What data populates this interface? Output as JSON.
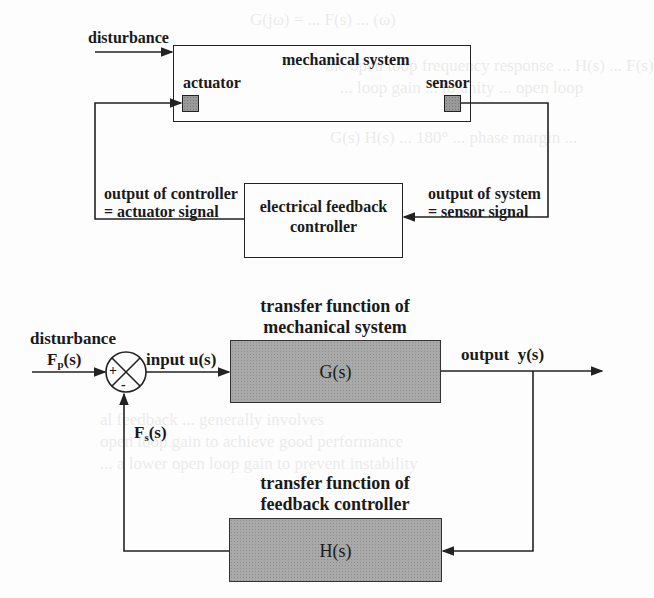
{
  "figure": {
    "top_diagram": {
      "input_label": "disturbance",
      "mechanical_box": {
        "title": "mechanical system",
        "actuator_label": "actuator",
        "sensor_label": "sensor"
      },
      "controller_box": {
        "line1": "electrical feedback",
        "line2": "controller"
      },
      "left_annotation": {
        "line1": "output of controller",
        "line2": "= actuator signal"
      },
      "right_annotation": {
        "line1": "output of system",
        "line2": "= sensor signal"
      }
    },
    "block_diagram": {
      "disturbance_label": "disturbance",
      "disturbance_signal": "F",
      "disturbance_sub": "p",
      "disturbance_arg": "(s)",
      "summing_junction": {
        "plus": "+",
        "minus": "-"
      },
      "input_label": "input u(s)",
      "plant": {
        "caption_line1": "transfer function of",
        "caption_line2": "mechanical system",
        "label": "G(s)"
      },
      "output_label": "output  y(s)",
      "feedback_signal": "F",
      "feedback_sub": "s",
      "feedback_arg": "(s)",
      "controller": {
        "caption_line1": "transfer function of",
        "caption_line2": "feedback controller",
        "label": "H(s)"
      }
    },
    "colors": {
      "line": "#222222",
      "block_fill": "#a9a9a9",
      "background": "#fdfdfd"
    }
  }
}
